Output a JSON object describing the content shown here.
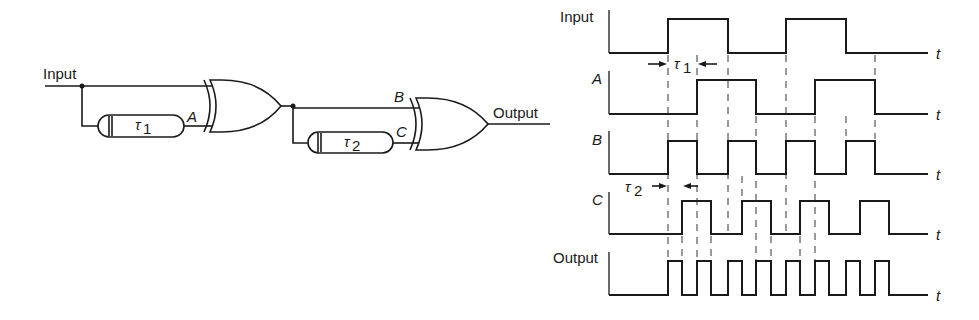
{
  "circuit": {
    "input_label": "Input",
    "output_label": "Output",
    "delay1_label": "τ",
    "delay1_sub": "1",
    "delay2_label": "τ",
    "delay2_sub": "2",
    "node_a": "A",
    "node_b": "B",
    "node_c": "C",
    "gates": [
      "XOR",
      "XOR"
    ]
  },
  "timing": {
    "axis_symbol": "t",
    "tau1_label": "τ",
    "tau1_sub": "1",
    "tau2_label": "τ",
    "tau2_sub": "2",
    "traces": [
      {
        "name": "Input",
        "label": "Input",
        "italic": false,
        "high_y": 19,
        "low_y": 53,
        "pulses": [
          [
            668,
            728
          ],
          [
            786,
            846
          ]
        ]
      },
      {
        "name": "A",
        "label": "A",
        "italic": true,
        "high_y": 80,
        "low_y": 114,
        "pulses": [
          [
            697,
            756
          ],
          [
            815,
            875
          ]
        ]
      },
      {
        "name": "B",
        "label": "B",
        "italic": true,
        "high_y": 141,
        "low_y": 174,
        "pulses": [
          [
            668,
            697
          ],
          [
            728,
            756
          ],
          [
            786,
            815
          ],
          [
            846,
            875
          ]
        ]
      },
      {
        "name": "C",
        "label": "C",
        "italic": true,
        "high_y": 201,
        "low_y": 234,
        "pulses": [
          [
            682,
            711
          ],
          [
            742,
            771
          ],
          [
            800,
            829
          ],
          [
            860,
            889
          ]
        ]
      },
      {
        "name": "Output",
        "label": "Output",
        "italic": false,
        "high_y": 261,
        "low_y": 295,
        "pulses": [
          [
            668,
            682
          ],
          [
            697,
            711
          ],
          [
            728,
            742
          ],
          [
            756,
            771
          ],
          [
            786,
            800
          ],
          [
            815,
            829
          ],
          [
            846,
            860
          ],
          [
            875,
            889
          ]
        ]
      }
    ],
    "axis_x_start": 609,
    "axis_x_end": 928
  }
}
